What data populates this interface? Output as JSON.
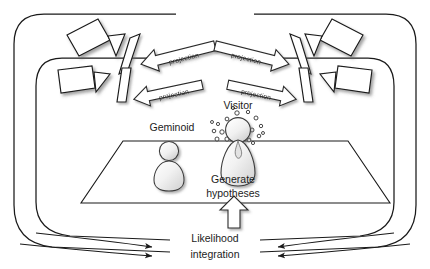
{
  "diagram": {
    "background_color": "#ffffff",
    "stroke_color": "#1a1a1a",
    "labels": {
      "geminoid": "Geminoid",
      "visitor": "Visitor",
      "generate_hypotheses_line1": "Generate",
      "generate_hypotheses_line2": "hypotheses",
      "likelihood_line1": "Likelihood",
      "likelihood_line2": "integration"
    },
    "projection_arrows": [
      {
        "id": "proj-top-left",
        "label": "projection",
        "direction": "left"
      },
      {
        "id": "proj-bottom-left",
        "label": "projection",
        "direction": "left"
      },
      {
        "id": "proj-top-right",
        "label": "projection",
        "direction": "right"
      },
      {
        "id": "proj-bottom-right",
        "label": "projection",
        "direction": "right"
      }
    ],
    "cameras": [
      {
        "id": "camera-top-left",
        "side": "left",
        "row": "top"
      },
      {
        "id": "camera-bottom-left",
        "side": "left",
        "row": "bottom"
      },
      {
        "id": "camera-top-right",
        "side": "right",
        "row": "top"
      },
      {
        "id": "camera-bottom-right",
        "side": "right",
        "row": "bottom"
      }
    ],
    "figures": [
      {
        "id": "geminoid-figure",
        "label": "Geminoid"
      },
      {
        "id": "visitor-figure",
        "label": "Visitor",
        "has_particle_cloud": true,
        "particle_count": 22
      }
    ],
    "flow_arrows": [
      {
        "id": "feedback-outer-left",
        "direction": "right"
      },
      {
        "id": "feedback-inner-left",
        "direction": "right"
      },
      {
        "id": "feedback-outer-right",
        "direction": "left"
      },
      {
        "id": "feedback-inner-right",
        "direction": "left"
      },
      {
        "id": "likelihood-up-arrow",
        "direction": "up"
      }
    ]
  }
}
